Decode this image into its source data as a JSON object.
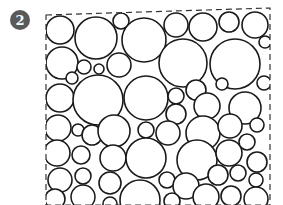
{
  "figure": {
    "badge": {
      "label": "2",
      "cx": 20,
      "cy": 20,
      "r": 10,
      "fill": "#5a5a5a",
      "text_color": "#ffffff"
    },
    "frame": {
      "points": [
        [
          46,
          15
        ],
        [
          270,
          8
        ],
        [
          270,
          205
        ],
        [
          46,
          205
        ]
      ],
      "stroke": "#333333",
      "dash": "6,4"
    },
    "circle_stroke": "#1a1a1a",
    "circle_stroke_width": 1.6,
    "circles": [
      {
        "cx": 60,
        "cy": 30,
        "r": 14
      },
      {
        "cx": 96,
        "cy": 38,
        "r": 21
      },
      {
        "cx": 121,
        "cy": 21,
        "r": 8
      },
      {
        "cx": 144,
        "cy": 40,
        "r": 22
      },
      {
        "cx": 176,
        "cy": 25,
        "r": 12
      },
      {
        "cx": 203,
        "cy": 27,
        "r": 14
      },
      {
        "cx": 229,
        "cy": 22,
        "r": 10
      },
      {
        "cx": 255,
        "cy": 25,
        "r": 13
      },
      {
        "cx": 265,
        "cy": 42,
        "r": 6
      },
      {
        "cx": 62,
        "cy": 63,
        "r": 16
      },
      {
        "cx": 84,
        "cy": 67,
        "r": 7
      },
      {
        "cx": 99,
        "cy": 69,
        "r": 5
      },
      {
        "cx": 119,
        "cy": 65,
        "r": 12
      },
      {
        "cx": 72,
        "cy": 78,
        "r": 6
      },
      {
        "cx": 183,
        "cy": 63,
        "r": 24
      },
      {
        "cx": 235,
        "cy": 64,
        "r": 25
      },
      {
        "cx": 264,
        "cy": 83,
        "r": 7
      },
      {
        "cx": 60,
        "cy": 98,
        "r": 14
      },
      {
        "cx": 98,
        "cy": 100,
        "r": 25
      },
      {
        "cx": 146,
        "cy": 98,
        "r": 22
      },
      {
        "cx": 176,
        "cy": 96,
        "r": 8
      },
      {
        "cx": 196,
        "cy": 90,
        "r": 10
      },
      {
        "cx": 176,
        "cy": 114,
        "r": 10
      },
      {
        "cx": 207,
        "cy": 106,
        "r": 13
      },
      {
        "cx": 222,
        "cy": 84,
        "r": 6
      },
      {
        "cx": 245,
        "cy": 108,
        "r": 16
      },
      {
        "cx": 58,
        "cy": 128,
        "r": 13
      },
      {
        "cx": 78,
        "cy": 130,
        "r": 6
      },
      {
        "cx": 92,
        "cy": 135,
        "r": 10
      },
      {
        "cx": 114,
        "cy": 131,
        "r": 16
      },
      {
        "cx": 146,
        "cy": 130,
        "r": 8
      },
      {
        "cx": 168,
        "cy": 133,
        "r": 12
      },
      {
        "cx": 203,
        "cy": 133,
        "r": 17
      },
      {
        "cx": 230,
        "cy": 126,
        "r": 12
      },
      {
        "cx": 257,
        "cy": 125,
        "r": 7
      },
      {
        "cx": 57,
        "cy": 153,
        "r": 13
      },
      {
        "cx": 81,
        "cy": 155,
        "r": 9
      },
      {
        "cx": 113,
        "cy": 158,
        "r": 13
      },
      {
        "cx": 146,
        "cy": 158,
        "r": 20
      },
      {
        "cx": 197,
        "cy": 160,
        "r": 20
      },
      {
        "cx": 229,
        "cy": 153,
        "r": 13
      },
      {
        "cx": 247,
        "cy": 142,
        "r": 8
      },
      {
        "cx": 257,
        "cy": 162,
        "r": 10
      },
      {
        "cx": 60,
        "cy": 180,
        "r": 12
      },
      {
        "cx": 83,
        "cy": 176,
        "r": 8
      },
      {
        "cx": 110,
        "cy": 183,
        "r": 11
      },
      {
        "cx": 167,
        "cy": 180,
        "r": 8
      },
      {
        "cx": 186,
        "cy": 186,
        "r": 13
      },
      {
        "cx": 218,
        "cy": 175,
        "r": 10
      },
      {
        "cx": 238,
        "cy": 173,
        "r": 8
      },
      {
        "cx": 256,
        "cy": 180,
        "r": 7
      },
      {
        "cx": 55,
        "cy": 199,
        "r": 10
      },
      {
        "cx": 83,
        "cy": 197,
        "r": 12
      },
      {
        "cx": 110,
        "cy": 204,
        "r": 7
      },
      {
        "cx": 140,
        "cy": 200,
        "r": 20
      },
      {
        "cx": 172,
        "cy": 201,
        "r": 8
      },
      {
        "cx": 206,
        "cy": 197,
        "r": 13
      },
      {
        "cx": 231,
        "cy": 196,
        "r": 10
      },
      {
        "cx": 256,
        "cy": 199,
        "r": 12
      }
    ]
  }
}
